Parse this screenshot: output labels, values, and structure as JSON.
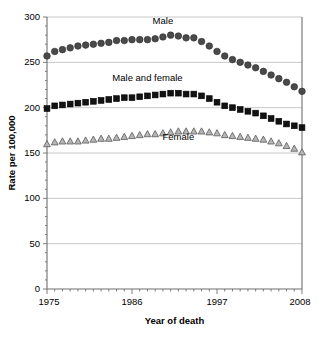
{
  "chart_data": {
    "type": "line",
    "title": "",
    "xlabel": "Year of death",
    "ylabel": "Rate per 100,000",
    "xlim": [
      1975,
      2008
    ],
    "ylim": [
      0,
      300
    ],
    "yticks": [
      0,
      50,
      100,
      150,
      200,
      250,
      300
    ],
    "xticks": [
      1975,
      1986,
      1997,
      2008
    ],
    "grid": "horizontal",
    "legend_position": "inline-annotations",
    "x": [
      1975,
      1976,
      1977,
      1978,
      1979,
      1980,
      1981,
      1982,
      1983,
      1984,
      1985,
      1986,
      1987,
      1988,
      1989,
      1990,
      1991,
      1992,
      1993,
      1994,
      1995,
      1996,
      1997,
      1998,
      1999,
      2000,
      2001,
      2002,
      2003,
      2004,
      2005,
      2006,
      2007,
      2008
    ],
    "series": [
      {
        "name": "Male",
        "marker": "circle",
        "color": "#4a4a4a",
        "label_x": 1990,
        "label_y": 292,
        "values": [
          257,
          262,
          264,
          266,
          268,
          269,
          270,
          271,
          272,
          274,
          274,
          275,
          275,
          275,
          276,
          278,
          280,
          279,
          277,
          277,
          273,
          268,
          262,
          257,
          253,
          250,
          247,
          244,
          240,
          236,
          232,
          228,
          223,
          218
        ]
      },
      {
        "name": "Male and female",
        "marker": "square",
        "color": "#121212",
        "label_x": 1988,
        "label_y": 229,
        "values": [
          199,
          202,
          203,
          204,
          205,
          206,
          207,
          208,
          209,
          210,
          211,
          211,
          212,
          213,
          214,
          215,
          216,
          216,
          215,
          215,
          213,
          210,
          206,
          202,
          200,
          198,
          196,
          194,
          191,
          188,
          185,
          182,
          180,
          178
        ]
      },
      {
        "name": "Female",
        "marker": "triangle",
        "color": "#b6b6b6",
        "label_x": 1992,
        "label_y": 164,
        "values": [
          160,
          162,
          163,
          163,
          163,
          164,
          165,
          166,
          166,
          167,
          168,
          169,
          170,
          171,
          171,
          172,
          173,
          174,
          174,
          174,
          174,
          173,
          172,
          170,
          169,
          168,
          167,
          166,
          165,
          163,
          161,
          158,
          155,
          151
        ]
      }
    ]
  }
}
